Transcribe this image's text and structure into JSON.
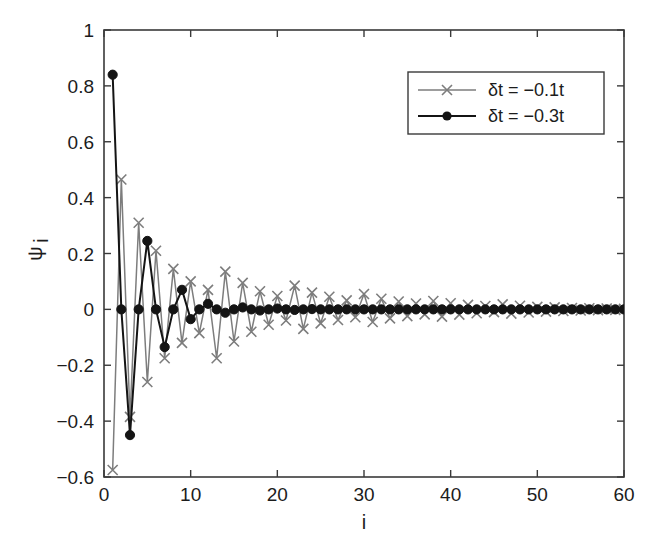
{
  "chart_data": {
    "type": "line",
    "title": "",
    "xlabel": "i",
    "ylabel": "ψ",
    "ylabel_sub": "i",
    "xlim": [
      0,
      60
    ],
    "ylim": [
      -0.6,
      1
    ],
    "xticks": [
      0,
      10,
      20,
      30,
      40,
      50,
      60
    ],
    "xticklabels": [
      "0",
      "10",
      "20",
      "30",
      "40",
      "50",
      "60"
    ],
    "yticks": [
      -0.6,
      -0.4,
      -0.2,
      0,
      0.2,
      0.4,
      0.6,
      0.8,
      1
    ],
    "yticklabels": [
      "−0.6",
      "−0.4",
      "−0.2",
      "0",
      "0.2",
      "0.4",
      "0.6",
      "0.8",
      "1"
    ],
    "grid": false,
    "legend_position": "upper right",
    "x": [
      1,
      2,
      3,
      4,
      5,
      6,
      7,
      8,
      9,
      10,
      11,
      12,
      13,
      14,
      15,
      16,
      17,
      18,
      19,
      20,
      21,
      22,
      23,
      24,
      25,
      26,
      27,
      28,
      29,
      30,
      31,
      32,
      33,
      34,
      35,
      36,
      37,
      38,
      39,
      40,
      41,
      42,
      43,
      44,
      45,
      46,
      47,
      48,
      49,
      50,
      51,
      52,
      53,
      54,
      55,
      56,
      57,
      58,
      59,
      60
    ],
    "series": [
      {
        "name": "δt = −0.1t",
        "color": "#7d7d7d",
        "marker": "x",
        "values": [
          -0.575,
          0.465,
          -0.385,
          0.31,
          -0.26,
          0.21,
          -0.175,
          0.145,
          -0.12,
          0.1,
          -0.085,
          0.07,
          -0.175,
          0.135,
          -0.115,
          0.095,
          -0.08,
          0.065,
          -0.055,
          0.048,
          -0.04,
          0.085,
          -0.07,
          0.06,
          -0.05,
          0.045,
          -0.038,
          0.032,
          -0.028,
          0.055,
          -0.045,
          0.038,
          -0.032,
          0.028,
          -0.024,
          0.021,
          -0.018,
          0.03,
          -0.026,
          0.022,
          -0.019,
          0.016,
          -0.014,
          0.012,
          -0.01,
          0.018,
          -0.015,
          0.013,
          -0.011,
          0.009,
          -0.008,
          0.007,
          -0.006,
          0.005,
          -0.004,
          0.004,
          -0.003,
          0.003,
          -0.002,
          0.002
        ]
      },
      {
        "name": "δt = −0.3t",
        "color": "#141414",
        "marker": "o",
        "values": [
          0.84,
          0.0,
          -0.45,
          0.0,
          0.245,
          0.0,
          -0.135,
          0.0,
          0.07,
          -0.035,
          0.0,
          0.02,
          0.0,
          -0.012,
          0.0,
          0.007,
          0.0,
          -0.004,
          0.0,
          0.003,
          0.0,
          -0.002,
          0.0,
          0.001,
          0.0,
          0.0,
          0.0,
          0.0,
          0.0,
          0.0,
          0.0,
          0.0,
          0.0,
          0.0,
          0.0,
          0.0,
          0.0,
          0.0,
          0.0,
          0.0,
          0.0,
          0.0,
          0.0,
          0.0,
          0.0,
          0.0,
          0.0,
          0.0,
          0.0,
          0.0,
          0.0,
          0.0,
          0.0,
          0.0,
          0.0,
          0.0,
          0.0,
          0.0,
          0.0,
          0.0
        ]
      }
    ]
  },
  "legend": {
    "entries": [
      {
        "label": "δt = −0.1t"
      },
      {
        "label": "δt = −0.3t"
      }
    ]
  }
}
